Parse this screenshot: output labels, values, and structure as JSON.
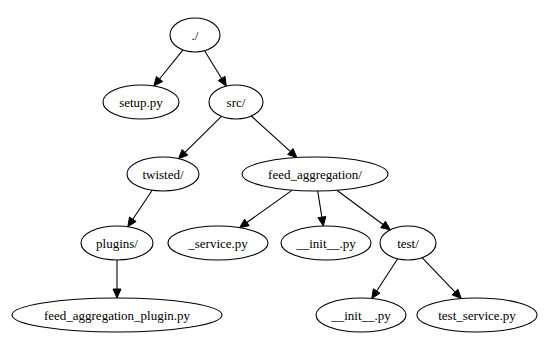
{
  "diagram": {
    "type": "directory-tree",
    "nodes": [
      {
        "id": "root",
        "label": "./",
        "cx": 195,
        "cy": 35,
        "rx": 25,
        "ry": 17
      },
      {
        "id": "setup",
        "label": "setup.py",
        "cx": 141,
        "cy": 102,
        "rx": 38,
        "ry": 17
      },
      {
        "id": "src",
        "label": "src/",
        "cx": 236,
        "cy": 102,
        "rx": 27,
        "ry": 17
      },
      {
        "id": "twisted",
        "label": "twisted/",
        "cx": 163,
        "cy": 174,
        "rx": 36,
        "ry": 17
      },
      {
        "id": "feed_aggregation",
        "label": "feed_aggregation/",
        "cx": 315,
        "cy": 174,
        "rx": 73,
        "ry": 17
      },
      {
        "id": "plugins",
        "label": "plugins/",
        "cx": 117,
        "cy": 243,
        "rx": 36,
        "ry": 17
      },
      {
        "id": "service",
        "label": "_service.py",
        "cx": 218,
        "cy": 243,
        "rx": 50,
        "ry": 17
      },
      {
        "id": "init_a",
        "label": "__init__.py",
        "cx": 326,
        "cy": 243,
        "rx": 45,
        "ry": 17
      },
      {
        "id": "test",
        "label": "test/",
        "cx": 408,
        "cy": 243,
        "rx": 28,
        "ry": 17
      },
      {
        "id": "plugin_py",
        "label": "feed_aggregation_plugin.py",
        "cx": 117,
        "cy": 315,
        "rx": 105,
        "ry": 17
      },
      {
        "id": "init_b",
        "label": "__init__.py",
        "cx": 361,
        "cy": 315,
        "rx": 45,
        "ry": 17
      },
      {
        "id": "test_service",
        "label": "test_service.py",
        "cx": 477,
        "cy": 315,
        "rx": 60,
        "ry": 17
      }
    ],
    "edges": [
      {
        "from": "root",
        "to": "setup"
      },
      {
        "from": "root",
        "to": "src"
      },
      {
        "from": "src",
        "to": "twisted"
      },
      {
        "from": "src",
        "to": "feed_aggregation"
      },
      {
        "from": "twisted",
        "to": "plugins"
      },
      {
        "from": "plugins",
        "to": "plugin_py"
      },
      {
        "from": "feed_aggregation",
        "to": "service"
      },
      {
        "from": "feed_aggregation",
        "to": "init_a"
      },
      {
        "from": "feed_aggregation",
        "to": "test"
      },
      {
        "from": "test",
        "to": "init_b"
      },
      {
        "from": "test",
        "to": "test_service"
      }
    ]
  }
}
